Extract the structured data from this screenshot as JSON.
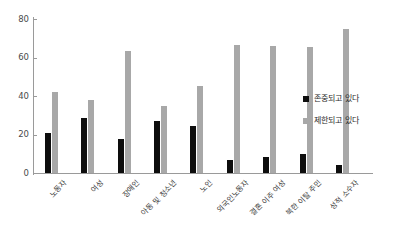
{
  "chart_data": {
    "type": "bar",
    "title": "",
    "xlabel": "",
    "ylabel": "",
    "ylim": [
      0,
      80
    ],
    "yticks": [
      "0",
      "20",
      "40",
      "60",
      "80"
    ],
    "grid": false,
    "legend_position": "right",
    "categories": [
      "노동자",
      "여성",
      "장애인",
      "아동 및 청소년",
      "노인",
      "외국인노동자",
      "결혼 이주 여성",
      "북한 이탈 주민",
      "성적 소수자"
    ],
    "series": [
      {
        "name": "존중되고 있다",
        "color": "#0d0d0d",
        "values": [
          21,
          28.5,
          17.5,
          27,
          24.5,
          7,
          8.5,
          10,
          4
        ]
      },
      {
        "name": "제한되고 있다",
        "color": "#a8a8a8",
        "values": [
          42,
          38,
          63.5,
          35,
          45,
          66.5,
          66,
          65.5,
          75
        ]
      }
    ]
  }
}
